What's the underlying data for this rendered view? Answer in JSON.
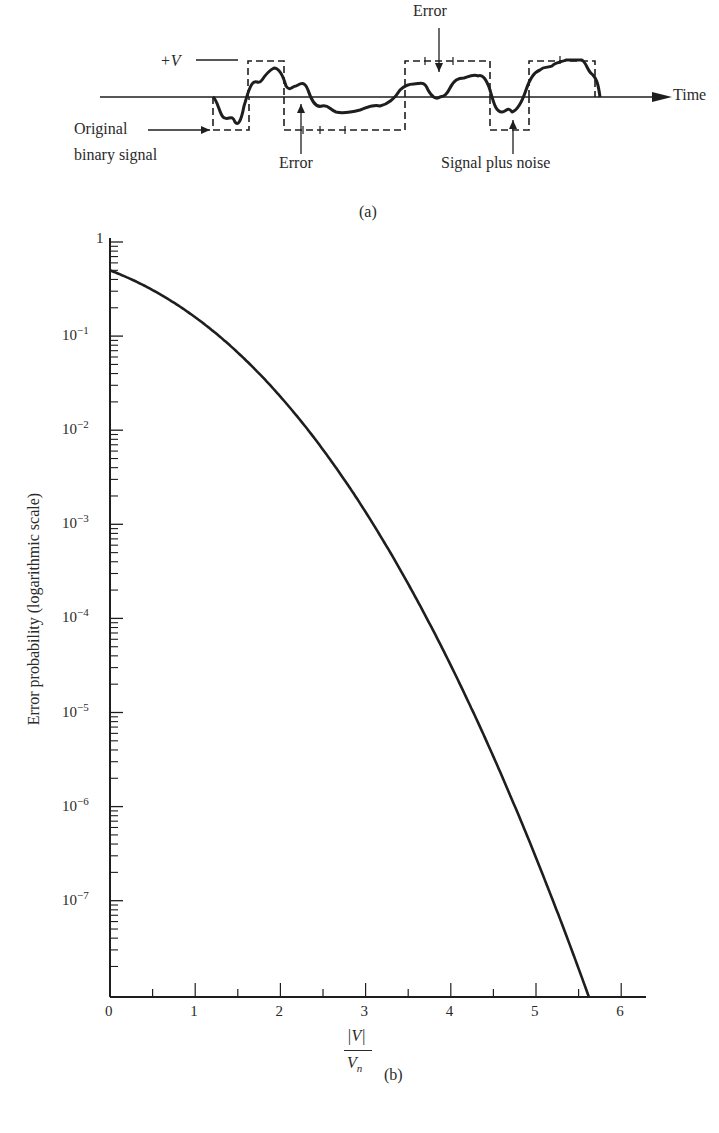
{
  "part_a": {
    "label": "(a)",
    "plus_v_label": "+V",
    "time_label": "Time",
    "original_label_line1": "Original",
    "original_label_line2": "binary signal",
    "error_label_bottom": "Error",
    "error_label_top": "Error",
    "signal_noise_label": "Signal plus noise"
  },
  "part_b": {
    "label": "(b)",
    "ylabel": "Error probability (logarithmic scale)",
    "xlabel_num": "|V|",
    "xlabel_den": "V",
    "xlabel_sub": "n",
    "y_ticks": [
      {
        "base": "1",
        "exp": ""
      },
      {
        "base": "10",
        "exp": "−1"
      },
      {
        "base": "10",
        "exp": "−2"
      },
      {
        "base": "10",
        "exp": "−3"
      },
      {
        "base": "10",
        "exp": "−4"
      },
      {
        "base": "10",
        "exp": "−5"
      },
      {
        "base": "10",
        "exp": "−6"
      },
      {
        "base": "10",
        "exp": "−7"
      }
    ],
    "x_ticks": [
      "0",
      "1",
      "2",
      "3",
      "4",
      "5",
      "6"
    ]
  },
  "chart_data": {
    "type": "line",
    "title": "",
    "xlabel": "|V| / V_n",
    "ylabel": "Error probability (logarithmic scale)",
    "yscale": "log",
    "xlim": [
      0,
      6.3
    ],
    "ylim": [
      1e-08,
      1
    ],
    "x_ticks": [
      0,
      1,
      2,
      3,
      4,
      5,
      6
    ],
    "y_ticks": [
      1,
      0.1,
      0.01,
      0.001,
      0.0001,
      1e-05,
      1e-06,
      1e-07
    ],
    "grid": false,
    "series": [
      {
        "name": "Error probability",
        "x": [
          0,
          0.5,
          1,
          1.5,
          2,
          2.5,
          3,
          3.5,
          4,
          4.5,
          5,
          5.5,
          5.6
        ],
        "y": [
          0.5,
          0.31,
          0.16,
          0.067,
          0.023,
          0.0062,
          0.00135,
          0.00023,
          3.2e-05,
          3.4e-06,
          2.9e-07,
          1.9e-08,
          1.1e-08
        ]
      }
    ]
  }
}
